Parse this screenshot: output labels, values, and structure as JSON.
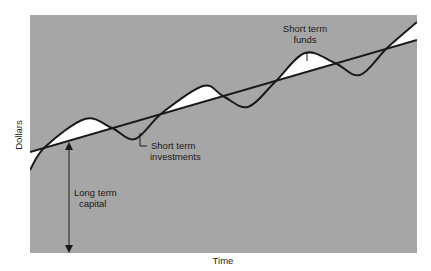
{
  "chart_data": {
    "type": "line",
    "title": "",
    "xlabel": "Time",
    "ylabel": "Dollars",
    "grid": false,
    "legend": null,
    "series": [
      {
        "name": "Long term capital (trend line)",
        "points": [
          [
            30,
            152
          ],
          [
            417,
            40
          ]
        ]
      },
      {
        "name": "Total funding need (seasonal curve)",
        "points": [
          [
            30,
            170
          ],
          [
            45,
            147
          ],
          [
            85,
            119
          ],
          [
            112,
            128
          ],
          [
            135,
            139
          ],
          [
            162,
            113
          ],
          [
            203,
            86
          ],
          [
            223,
            96
          ],
          [
            248,
            107
          ],
          [
            275,
            82
          ],
          [
            305,
            53
          ],
          [
            335,
            63
          ],
          [
            360,
            75
          ],
          [
            387,
            48
          ],
          [
            417,
            22
          ]
        ]
      }
    ],
    "annotations": [
      {
        "text": [
          "Short term",
          "funds"
        ],
        "x": 307,
        "y": 30
      },
      {
        "text": [
          "Short term",
          "investments"
        ],
        "x": 150,
        "y": 143
      },
      {
        "text": [
          "Long term",
          "capital"
        ],
        "x": 74,
        "y": 194
      }
    ],
    "colors": {
      "plot_background": "#a6a6a6",
      "fill_between": "#ffffff",
      "line": "#1a1a1a"
    }
  },
  "labels": {
    "ylabel": "Dollars",
    "xlabel": "Time",
    "funds_line1": "Short term",
    "funds_line2": "funds",
    "invest_line1": "Short term",
    "invest_line2": "investments",
    "capital_line1": "Long term",
    "capital_line2": "capital"
  }
}
